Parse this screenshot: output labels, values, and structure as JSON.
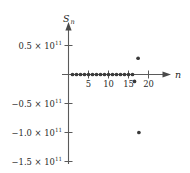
{
  "chart_data": {
    "type": "scatter",
    "title": "",
    "xlabel": "n",
    "ylabel": "S_n",
    "xlim": [
      -1.2,
      23.5
    ],
    "ylim": [
      -178000000000.0,
      78000000000.0
    ],
    "grid": false,
    "legend": null,
    "x_ticks": [
      {
        "value": 5,
        "label": "5"
      },
      {
        "value": 10,
        "label": "10"
      },
      {
        "value": 15,
        "label": "15"
      },
      {
        "value": 20,
        "label": "20"
      }
    ],
    "y_ticks": [
      {
        "value": 50000000000.0,
        "label": "0.5 × 10",
        "exponent": "11"
      },
      {
        "value": -50000000000.0,
        "label": "−0.5 × 10",
        "exponent": "11"
      },
      {
        "value": -100000000000.0,
        "label": "−1.0 × 10",
        "exponent": "11"
      },
      {
        "value": -150000000000.0,
        "label": "−1.5 × 10",
        "exponent": "11"
      }
    ],
    "x": [
      1,
      2,
      3,
      4,
      5,
      6,
      7,
      8,
      9,
      10,
      11,
      12,
      13,
      14,
      15,
      16,
      16.5,
      17.4,
      17.6
    ],
    "y": [
      0,
      0,
      0,
      0,
      0,
      0,
      0,
      0,
      0,
      0,
      0,
      0,
      0,
      0,
      0,
      0,
      -12000000000.0,
      28000000000.0,
      -100000000000.0
    ],
    "series": [
      {
        "name": "S_n",
        "marker": "filled-circle",
        "color": "#3a3a3a",
        "points": [
          {
            "x": 1,
            "y": 0
          },
          {
            "x": 2,
            "y": 0
          },
          {
            "x": 3,
            "y": 0
          },
          {
            "x": 4,
            "y": 0
          },
          {
            "x": 5,
            "y": 0
          },
          {
            "x": 6,
            "y": 0
          },
          {
            "x": 7,
            "y": 0
          },
          {
            "x": 8,
            "y": 0
          },
          {
            "x": 9,
            "y": 0
          },
          {
            "x": 10,
            "y": 0
          },
          {
            "x": 11,
            "y": 0
          },
          {
            "x": 12,
            "y": 0
          },
          {
            "x": 13,
            "y": 0
          },
          {
            "x": 14,
            "y": 0
          },
          {
            "x": 15,
            "y": 0
          },
          {
            "x": 16,
            "y": 0
          },
          {
            "x": 16.5,
            "y": -12000000000.0
          },
          {
            "x": 17.4,
            "y": 28000000000.0
          },
          {
            "x": 17.6,
            "y": -100000000000.0
          }
        ]
      }
    ],
    "axis_labels": {
      "y_symbol": "S",
      "y_subscript": "n",
      "x_symbol": "n"
    },
    "colors": {
      "axis": "#5a5a5a",
      "marker": "#3a3a3a",
      "text": "#2b2b2b",
      "background": "#ffffff"
    }
  }
}
